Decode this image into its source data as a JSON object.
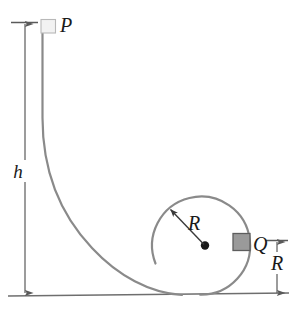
{
  "figure": {
    "type": "physics-diagram",
    "colors": {
      "track": "#8a8a8a",
      "ground": "#6e6e6e",
      "dimension": "#5a5a5a",
      "radius_arrow": "#3a3a3a",
      "block_p_fill": "#f2f2f2",
      "block_q_fill": "#9a9a9a",
      "label_text": "#1a1a1a",
      "background": "#ffffff"
    },
    "labels": {
      "height": "h",
      "radius": "R",
      "radius_dimension": "R",
      "point_start": "P",
      "point_end": "Q"
    },
    "elements": {
      "block_p_name": "block-at-p",
      "block_q_name": "block-at-q",
      "ground_name": "ground-line",
      "loop_name": "circular-loop-track",
      "ramp_name": "curved-ramp-track",
      "center_name": "loop-center-dot"
    }
  }
}
